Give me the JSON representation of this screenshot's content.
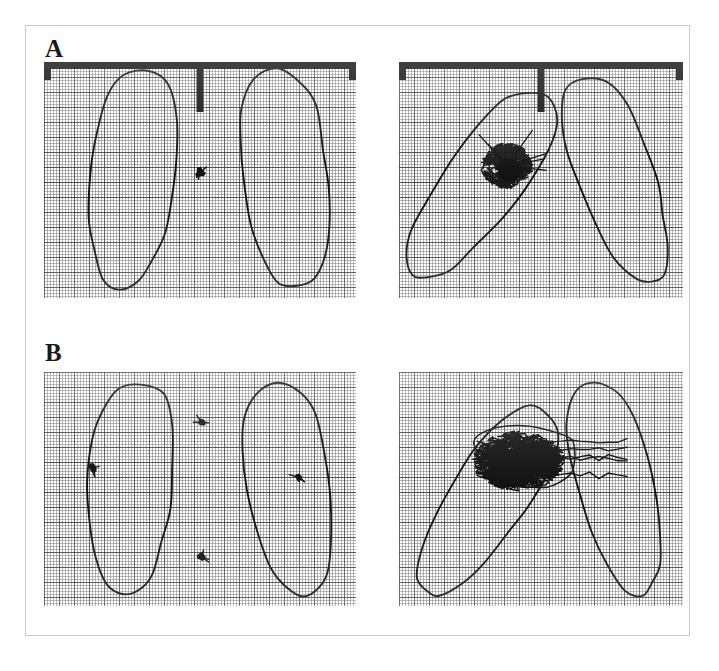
{
  "figure": {
    "background_color": "#ffffff",
    "frame_color": "#c9c9c9",
    "ink_color": "#111111",
    "grid_color": "#4a4a4a",
    "panel_count": 4,
    "label_a": "A",
    "label_b": "B"
  },
  "chart_data": {
    "type": "scatter",
    "xlabel": "",
    "ylabel": "",
    "grid": true,
    "legend_position": "none",
    "panels": [
      {
        "id": "A-left",
        "row_label": "A",
        "column": "left",
        "condition": "eyes open / quiet stance",
        "has_top_bar": true,
        "bar_ticks": [
          "left",
          "center",
          "right"
        ],
        "center_tick_length_px": 50,
        "trace_type": "point",
        "trace_extent_mm": {
          "width": 8,
          "height": 8
        },
        "trace_center": {
          "x": 0.5,
          "y": 0.47
        },
        "feet": [
          {
            "side": "left",
            "center": {
              "x": 0.28,
              "y": 0.5
            },
            "rotation_deg": 8
          },
          {
            "side": "right",
            "center": {
              "x": 0.77,
              "y": 0.5
            },
            "rotation_deg": -5
          }
        ]
      },
      {
        "id": "A-right",
        "row_label": "A",
        "column": "right",
        "condition": "perturbed / eyes closed",
        "has_top_bar": true,
        "bar_ticks": [
          "left",
          "center",
          "right"
        ],
        "center_tick_length_px": 50,
        "trace_type": "dense-cluster",
        "trace_extent_mm": {
          "width": 52,
          "height": 46
        },
        "trace_center": {
          "x": 0.38,
          "y": 0.44
        },
        "feet": [
          {
            "side": "left",
            "center": {
              "x": 0.28,
              "y": 0.52
            },
            "rotation_deg": 38
          },
          {
            "side": "right",
            "center": {
              "x": 0.76,
              "y": 0.5
            },
            "rotation_deg": -18
          }
        ]
      },
      {
        "id": "B-left",
        "row_label": "B",
        "column": "left",
        "condition": "quiet stance, discrete samples",
        "has_top_bar": false,
        "bar_ticks": [],
        "trace_type": "points",
        "point_count": 4,
        "points": [
          {
            "x": 0.155,
            "y": 0.41
          },
          {
            "x": 0.505,
            "y": 0.215
          },
          {
            "x": 0.505,
            "y": 0.79
          },
          {
            "x": 0.815,
            "y": 0.45
          }
        ],
        "feet": [
          {
            "side": "left",
            "center": {
              "x": 0.27,
              "y": 0.5
            },
            "rotation_deg": 6
          },
          {
            "side": "right",
            "center": {
              "x": 0.78,
              "y": 0.5
            },
            "rotation_deg": -6
          }
        ]
      },
      {
        "id": "B-right",
        "row_label": "B",
        "column": "right",
        "condition": "perturbed, wide lateral sway",
        "has_top_bar": false,
        "bar_ticks": [],
        "trace_type": "wide-zigzag",
        "trace_extent_mm": {
          "width": 150,
          "height": 60
        },
        "trace_center": {
          "x": 0.42,
          "y": 0.38
        },
        "feet": [
          {
            "side": "left",
            "center": {
              "x": 0.3,
              "y": 0.55
            },
            "rotation_deg": 35
          },
          {
            "side": "right",
            "center": {
              "x": 0.76,
              "y": 0.5
            },
            "rotation_deg": -12
          }
        ]
      }
    ]
  },
  "panels": {
    "a_left": {
      "name": "panel-a-left"
    },
    "a_right": {
      "name": "panel-a-right"
    },
    "b_left": {
      "name": "panel-b-left"
    },
    "b_right": {
      "name": "panel-b-right"
    }
  }
}
